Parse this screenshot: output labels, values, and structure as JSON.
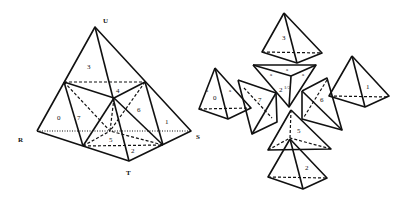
{
  "figure": {
    "left": {
      "title": "tetrahedron-subdivided",
      "vertices": {
        "U": "U",
        "R": "R",
        "S": "S",
        "T": "T"
      },
      "region_labels": [
        "0",
        "1",
        "2",
        "3",
        "4",
        "5",
        "6",
        "7"
      ]
    },
    "right": {
      "title": "exploded-pieces",
      "piece_labels": [
        "3",
        "0",
        "7",
        "2",
        "6",
        "1",
        "5",
        "2"
      ],
      "center_label": "2",
      "center_sub": "1/2",
      "edge_label": "a"
    }
  }
}
